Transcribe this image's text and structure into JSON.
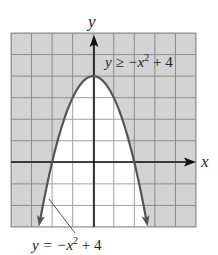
{
  "figure": {
    "type": "inequality-graph",
    "x_axis_label": "x",
    "y_axis_label": "y",
    "grid": {
      "x_min": -4,
      "x_max": 5,
      "y_min": -3,
      "y_max": 6,
      "step": 1
    },
    "boundary_curve": {
      "equation_label": "y = −x² + 4",
      "label_parts": {
        "lhs": "y = −x",
        "exp": "2",
        "rhs": " + 4"
      },
      "style": "solid",
      "vertex": [
        0,
        4
      ],
      "x_intercepts": [
        -2,
        2
      ]
    },
    "inequality": {
      "label": "y ≥ −x² + 4",
      "label_parts": {
        "lhs": "y ≥ −x",
        "exp": "2",
        "rhs": " + 4"
      }
    },
    "colors": {
      "shaded_fill": "#d3d3d3",
      "shaded_grid": "#8c8c8c",
      "unshaded_fill": "#ffffff",
      "unshaded_grid": "#a0a0a0",
      "curve": "#555555",
      "axes": "#111111"
    }
  }
}
